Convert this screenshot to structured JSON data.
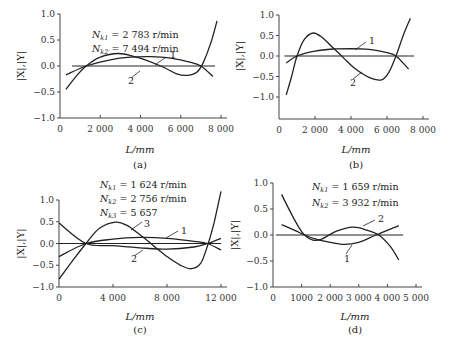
{
  "chart_data": [
    {
      "id": "a",
      "type": "line",
      "caption": "(a)",
      "xlabel": "L/mm",
      "ylabel": "|X|,|Y|",
      "xlim": [
        0,
        8000
      ],
      "ylim": [
        -1.0,
        1.0
      ],
      "xticks": [
        0,
        2000,
        4000,
        6000,
        8000
      ],
      "xtick_labels": [
        "0",
        "2 000",
        "4 000",
        "6 000",
        "8 000"
      ],
      "yticks": [
        1.0,
        0.5,
        0.0,
        -0.5,
        -1.0
      ],
      "ytick_labels": [
        "1.0",
        "0.5",
        "0.0",
        "−0.5",
        "−1.0"
      ],
      "annotations": [
        "N_k1 = 2 783 r/min",
        "N_k2 = 7 494 r/min"
      ],
      "zero_line": [
        600,
        7700
      ],
      "series": [
        {
          "name": "1",
          "x": [
            300,
            1300,
            2500,
            3500,
            4500,
            5500,
            6500,
            7000,
            7600
          ],
          "y": [
            -0.17,
            0.0,
            0.12,
            0.17,
            0.18,
            0.15,
            0.07,
            0.0,
            -0.2
          ]
        },
        {
          "name": "2",
          "x": [
            300,
            800,
            1300,
            2000,
            2900,
            3800,
            5000,
            5800,
            6300,
            6800,
            7100,
            7500,
            7800
          ],
          "y": [
            -0.45,
            -0.2,
            0.0,
            0.17,
            0.24,
            0.17,
            0.0,
            -0.15,
            -0.18,
            -0.12,
            0.05,
            0.45,
            0.87
          ]
        }
      ]
    },
    {
      "id": "b",
      "type": "line",
      "caption": "(b)",
      "xlabel": "L/mm",
      "ylabel": "|X|,|Y|",
      "xlim": [
        0,
        8000
      ],
      "ylim": [
        -1.5,
        1.0
      ],
      "xticks": [
        0,
        2000,
        4000,
        6000,
        8000
      ],
      "xtick_labels": [
        "0",
        "2 000",
        "4 000",
        "6 000",
        "8 000"
      ],
      "yticks": [
        1.0,
        0.5,
        0.0,
        -0.5,
        -1.0
      ],
      "ytick_labels": [
        "1.0",
        "0.5",
        "0.0",
        "−0.5",
        "−1.0"
      ],
      "annotations": [],
      "zero_line": [
        300,
        7500
      ],
      "series": [
        {
          "name": "1",
          "x": [
            400,
            1000,
            2000,
            3000,
            4000,
            5000,
            6000,
            6500,
            7200
          ],
          "y": [
            -0.17,
            0.0,
            0.12,
            0.17,
            0.18,
            0.16,
            0.08,
            0.0,
            -0.32
          ]
        },
        {
          "name": "2",
          "x": [
            400,
            700,
            1000,
            1400,
            1900,
            2400,
            3000,
            3600,
            4200,
            5000,
            5700,
            6100,
            6500,
            6900,
            7300
          ],
          "y": [
            -0.95,
            -0.5,
            0.0,
            0.4,
            0.56,
            0.45,
            0.2,
            -0.05,
            -0.3,
            -0.52,
            -0.58,
            -0.4,
            0.0,
            0.5,
            0.92
          ]
        }
      ]
    },
    {
      "id": "c",
      "type": "line",
      "caption": "(c)",
      "xlabel": "L/mm",
      "ylabel": "|X|,|Y|",
      "xlim": [
        0,
        12000
      ],
      "ylim": [
        -1.0,
        1.0
      ],
      "xticks": [
        0,
        4000,
        8000,
        12000
      ],
      "xtick_labels": [
        "0",
        "4 000",
        "8 000",
        "12 000"
      ],
      "yticks": [
        1.0,
        0.5,
        0.0,
        -0.5,
        -1.0
      ],
      "ytick_labels": [
        "1.0",
        "0.5",
        "0.0",
        "−0.5",
        "−1.0"
      ],
      "annotations": [
        "N_k1 = 1 624 r/min",
        "N_k2 = 2 756 r/min",
        "N_k3 = 5 657"
      ],
      "zero_line": [
        0,
        12000
      ],
      "series": [
        {
          "name": "1",
          "x": [
            0,
            2000,
            4000,
            6000,
            8000,
            10000,
            11000,
            12000
          ],
          "y": [
            -0.3,
            0.0,
            0.1,
            0.14,
            0.12,
            0.05,
            0.0,
            -0.15
          ]
        },
        {
          "name": "2",
          "x": [
            0,
            2000,
            4000,
            6000,
            8000,
            10000,
            11000,
            12000
          ],
          "y": [
            0.47,
            0.0,
            -0.05,
            -0.1,
            -0.13,
            -0.08,
            0.0,
            0.12
          ]
        },
        {
          "name": "3",
          "x": [
            0,
            1000,
            2000,
            3000,
            4200,
            5000,
            6000,
            7000,
            8000,
            9000,
            9800,
            10500,
            11000,
            11500,
            12000
          ],
          "y": [
            -0.82,
            -0.4,
            0.0,
            0.35,
            0.49,
            0.42,
            0.2,
            -0.05,
            -0.3,
            -0.5,
            -0.58,
            -0.45,
            -0.05,
            0.5,
            1.2
          ]
        }
      ]
    },
    {
      "id": "d",
      "type": "line",
      "caption": "(d)",
      "xlabel": "L/mm",
      "ylabel": "|X|,|Y|",
      "xlim": [
        0,
        5000
      ],
      "ylim": [
        -1.0,
        1.0
      ],
      "xticks": [
        0,
        1000,
        2000,
        3000,
        4000,
        5000
      ],
      "xtick_labels": [
        "0",
        "1000",
        "2 000",
        "3 000",
        "4 000",
        "5 000"
      ],
      "yticks": [
        1.0,
        0.5,
        0.0,
        -0.5,
        -1.0
      ],
      "ytick_labels": [
        "1.0",
        "0.5",
        "0.0",
        "−0.5",
        "−1.0"
      ],
      "annotations": [
        "N_k1 = 1 659 r/min",
        "N_k2 = 3 932 r/min"
      ],
      "zero_line": [
        100,
        4550
      ],
      "series": [
        {
          "name": "1",
          "x": [
            300,
            800,
            1100,
            1500,
            2000,
            2500,
            3000,
            3600,
            4400
          ],
          "y": [
            0.2,
            0.08,
            0.0,
            -0.08,
            -0.14,
            -0.18,
            -0.14,
            0.0,
            0.18
          ]
        },
        {
          "name": "2",
          "x": [
            300,
            600,
            900,
            1100,
            1400,
            1700,
            2200,
            2800,
            3300,
            3700,
            4100,
            4400
          ],
          "y": [
            0.78,
            0.45,
            0.15,
            0.0,
            -0.1,
            -0.08,
            0.07,
            0.15,
            0.09,
            0.0,
            -0.22,
            -0.48
          ]
        }
      ]
    }
  ]
}
